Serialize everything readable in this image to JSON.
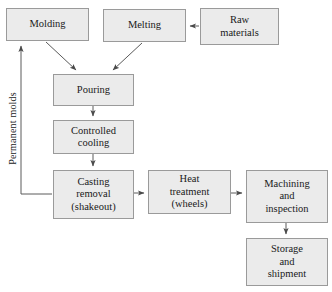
{
  "diagram": {
    "type": "flowchart",
    "nodes": [
      {
        "id": "molding",
        "lines": [
          "Molding"
        ]
      },
      {
        "id": "melting",
        "lines": [
          "Melting"
        ]
      },
      {
        "id": "raw",
        "lines": [
          "Raw",
          "materials"
        ]
      },
      {
        "id": "pouring",
        "lines": [
          "Pouring"
        ]
      },
      {
        "id": "cooling",
        "lines": [
          "Controlled",
          "cooling"
        ]
      },
      {
        "id": "shakeout",
        "lines": [
          "Casting",
          "removal",
          "(shakeout)"
        ]
      },
      {
        "id": "heat",
        "lines": [
          "Heat",
          "treatment",
          "(wheels)"
        ]
      },
      {
        "id": "machining",
        "lines": [
          "Machining",
          "and",
          "inspection"
        ]
      },
      {
        "id": "storage",
        "lines": [
          "Storage",
          "and",
          "shipment"
        ]
      }
    ],
    "edge_label_permanent_molds": "Permanent molds",
    "edges": [
      {
        "from": "raw",
        "to": "melting",
        "style": "horizontal-left"
      },
      {
        "from": "molding",
        "to": "pouring",
        "style": "diagonal"
      },
      {
        "from": "melting",
        "to": "pouring",
        "style": "diagonal"
      },
      {
        "from": "pouring",
        "to": "cooling",
        "style": "vertical-down"
      },
      {
        "from": "cooling",
        "to": "shakeout",
        "style": "vertical-down"
      },
      {
        "from": "shakeout",
        "to": "heat",
        "style": "horizontal-right"
      },
      {
        "from": "heat",
        "to": "machining",
        "style": "horizontal-right"
      },
      {
        "from": "machining",
        "to": "storage",
        "style": "vertical-down"
      },
      {
        "from": "shakeout",
        "to": "molding",
        "style": "feedback-loop",
        "label": "Permanent molds"
      }
    ],
    "colors": {
      "node_fill": "#ebebeb",
      "node_border": "#9a9a9a",
      "edge": "#555555",
      "text": "#1a1a1a",
      "background": "#ffffff"
    }
  }
}
